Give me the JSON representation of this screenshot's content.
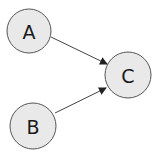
{
  "diagram": {
    "type": "directed-graph",
    "nodes": [
      {
        "id": "A",
        "label": "A",
        "cx": 29,
        "cy": 31,
        "r": 22
      },
      {
        "id": "B",
        "label": "B",
        "cx": 33,
        "cy": 126,
        "r": 23
      },
      {
        "id": "C",
        "label": "C",
        "cx": 128,
        "cy": 75,
        "r": 23
      }
    ],
    "edges": [
      {
        "from": "A",
        "to": "C",
        "x1": 51,
        "y1": 37,
        "x2": 107,
        "y2": 64
      },
      {
        "from": "B",
        "to": "C",
        "x1": 55,
        "y1": 113,
        "x2": 106,
        "y2": 88
      }
    ],
    "colors": {
      "node_fill": "#e9e9e9",
      "node_stroke": "#555555",
      "edge": "#444444",
      "text": "#1a1a1a"
    }
  }
}
